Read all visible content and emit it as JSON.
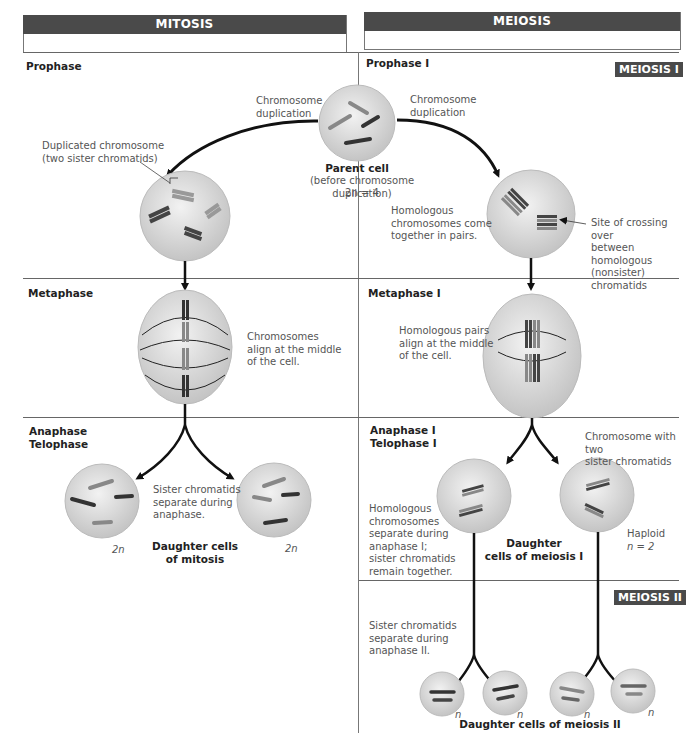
{
  "headers": {
    "mitosis": "MITOSIS",
    "meiosis": "MEIOSIS"
  },
  "badges": {
    "meiosis1": "MEIOSIS I",
    "meiosis2": "MEIOSIS II"
  },
  "mitosis": {
    "phases": {
      "prophase": "Prophase",
      "metaphase": "Metaphase",
      "anaphase_line1": "Anaphase",
      "anaphase_line2": "Telophase"
    },
    "notes": {
      "chromosome_duplication_line1": "Chromosome",
      "chromosome_duplication_line2": "duplication",
      "duplicated_line1": "Duplicated chromosome",
      "duplicated_line2": "(two sister chromatids)",
      "metaphase_line1": "Chromosomes",
      "metaphase_line2": "align at the middle",
      "metaphase_line3": "of the cell.",
      "anaphase_line1": "Sister chromatids",
      "anaphase_line2": "separate during",
      "anaphase_line3": "anaphase."
    },
    "ploidy_left": "2n",
    "ploidy_right": "2n",
    "daughter_label_line1": "Daughter cells",
    "daughter_label_line2": "of mitosis"
  },
  "parent_cell": {
    "title": "Parent cell",
    "subtitle": "(before chromosome duplication)",
    "ploidy": "2n = 4"
  },
  "meiosis": {
    "phases": {
      "prophase": "Prophase I",
      "metaphase": "Metaphase I",
      "anaphase_line1": "Anaphase I",
      "anaphase_line2": "Telophase I"
    },
    "notes": {
      "chromosome_duplication_line1": "Chromosome",
      "chromosome_duplication_line2": "duplication",
      "homologous_line1": "Homologous",
      "homologous_line2": "chromosomes come",
      "homologous_line3": "together in pairs.",
      "crossing_line1": "Site of crossing over",
      "crossing_line2": "between homologous",
      "crossing_line3": "(nonsister) chromatids",
      "metaphase_line1": "Homologous pairs",
      "metaphase_line2": "align at the middle",
      "metaphase_line3": "of the cell.",
      "two_sister_line1": "Chromosome with two",
      "two_sister_line2": "sister chromatids",
      "anaphase1_line1": "Homologous",
      "anaphase1_line2": "chromosomes",
      "anaphase1_line3": "separate during",
      "anaphase1_line4": "anaphase I;",
      "anaphase1_line5": "sister chromatids",
      "anaphase1_line6": "remain together.",
      "haploid_line1": "Haploid",
      "haploid_line2": "n = 2",
      "anaphase2_line1": "Sister chromatids",
      "anaphase2_line2": "separate during",
      "anaphase2_line3": "anaphase II."
    },
    "daughter1_line1": "Daughter",
    "daughter1_line2": "cells of meiosis I",
    "daughter2_label": "Daughter cells of meiosis II",
    "ploidy_n": [
      "n",
      "n",
      "n",
      "n"
    ]
  },
  "colors": {
    "header_bg": "#4a4a4a",
    "cell_fill": "#d6d6d6",
    "chromosome_dark": "#3a3a3a",
    "chromosome_light": "#8a8a8a",
    "arrow": "#111111"
  }
}
